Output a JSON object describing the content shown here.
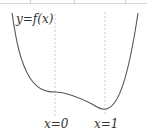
{
  "figure": {
    "function_label": "y=f(x)",
    "markers": [
      {
        "label": "x=0"
      },
      {
        "label": "x=1"
      }
    ],
    "colors": {
      "curve": "#555555",
      "guide": "#bbbbbb",
      "text": "#333333"
    }
  }
}
